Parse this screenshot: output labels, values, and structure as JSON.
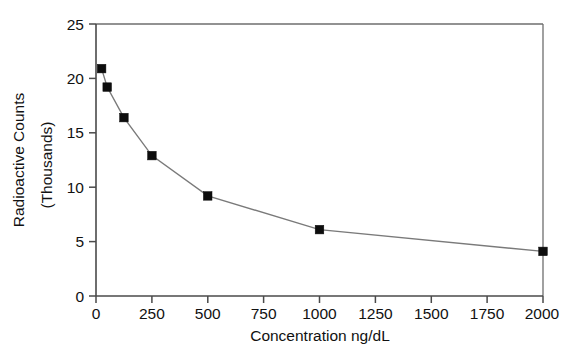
{
  "chart_data": {
    "type": "line",
    "title": "",
    "xlabel": "Concentration ng/dL",
    "ylabel_line1": "Radioactive Counts",
    "ylabel_line2": "(Thousands)",
    "xlim": [
      0,
      2000
    ],
    "ylim": [
      0,
      25
    ],
    "xticks": [
      0,
      250,
      500,
      750,
      1000,
      1250,
      1500,
      1750,
      2000
    ],
    "xtick_labels": [
      "0",
      "250",
      "500",
      "750",
      "1000",
      "1250",
      "1500",
      "1750",
      "2000"
    ],
    "yticks": [
      0,
      5,
      10,
      15,
      20,
      25
    ],
    "ytick_labels": [
      "0",
      "5",
      "10",
      "15",
      "20",
      "25"
    ],
    "grid": false,
    "legend": false,
    "marker": "square",
    "series": [
      {
        "name": "Radioactive Counts",
        "x": [
          25,
          50,
          125,
          250,
          500,
          1000,
          2000
        ],
        "values": [
          20.9,
          19.2,
          16.4,
          12.9,
          9.2,
          6.1,
          4.1
        ]
      }
    ]
  },
  "figure": {
    "background_color": "#ffffff",
    "line_color": "#7a7a7a",
    "marker_color": "#0d0d0d",
    "axis_color": "#4a4a4a"
  }
}
